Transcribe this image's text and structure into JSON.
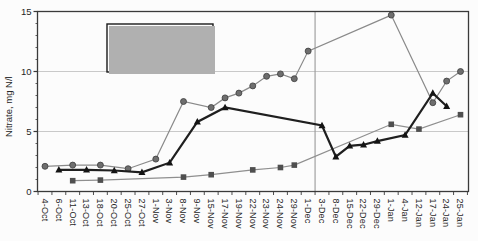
{
  "chart_data": {
    "type": "line",
    "title": "",
    "xlabel": "",
    "ylabel": "Nitrate, mg N/l",
    "ylim": [
      0,
      15
    ],
    "yticks": [
      0,
      5,
      10,
      15
    ],
    "grid": "horizontal gridlines at 5 and 10, plot fully framed",
    "legend_position": "inside plot, upper left",
    "categories": [
      "4-Oct",
      "6-Oct",
      "11-Oct",
      "13-Oct",
      "18-Oct",
      "20-Oct",
      "25-Oct",
      "27-Oct",
      "1-Nov",
      "3-Nov",
      "8-Nov",
      "9-Nov",
      "15-Nov",
      "17-Nov",
      "19-Nov",
      "22-Nov",
      "23-Nov",
      "24-Nov",
      "29-Nov",
      "1-Dec",
      "3-Dec",
      "8-Dec",
      "15-Dec",
      "22-Dec",
      "29-Dec",
      "1-Jan",
      "4-Jan",
      "12-Jan",
      "17-Jan",
      "24-Jan",
      "25-Jan"
    ],
    "series": [
      {
        "name": "Evergreen Lake",
        "marker": "square",
        "marker_color": "#4f4f4f",
        "line_color": "#8f8f8f",
        "line_width": 1.2,
        "values": [
          null,
          null,
          0.9,
          null,
          0.95,
          null,
          null,
          null,
          null,
          null,
          1.2,
          null,
          1.4,
          null,
          null,
          1.8,
          null,
          2.0,
          2.2,
          null,
          null,
          null,
          null,
          null,
          null,
          5.6,
          null,
          5.2,
          null,
          null,
          6.4
        ]
      },
      {
        "name": "Lake Bloomington",
        "marker": "circle",
        "marker_color": "#6e6e6e",
        "line_color": "#8a8a8a",
        "line_width": 1.2,
        "values": [
          2.1,
          null,
          2.2,
          null,
          2.2,
          null,
          1.9,
          null,
          2.7,
          null,
          7.5,
          null,
          7.0,
          7.8,
          8.2,
          8.8,
          9.6,
          9.8,
          9.4,
          11.7,
          null,
          null,
          null,
          null,
          null,
          14.7,
          null,
          null,
          7.4,
          9.2,
          10.0
        ]
      },
      {
        "name": "Finished Water",
        "marker": "triangle",
        "marker_color": "#141414",
        "line_color": "#1f1f1f",
        "line_width": 2.2,
        "values": [
          null,
          1.8,
          null,
          1.8,
          null,
          1.75,
          null,
          1.6,
          null,
          2.4,
          null,
          5.8,
          null,
          7.0,
          null,
          null,
          null,
          null,
          null,
          null,
          5.5,
          2.9,
          3.8,
          3.9,
          4.2,
          null,
          4.7,
          null,
          8.2,
          7.1,
          null
        ]
      }
    ],
    "annotations": {
      "vertical_reference_line": "gray vertical line spanning plot height between 1-Dec and 3-Dec"
    }
  },
  "colors": {
    "frame": "#3a3a3a",
    "gridline": "#c9c9c9",
    "reference_line": "#9a9a9a",
    "text": "#262626",
    "legend_border": "#1a1a1a",
    "background": "#fcfcfc"
  }
}
